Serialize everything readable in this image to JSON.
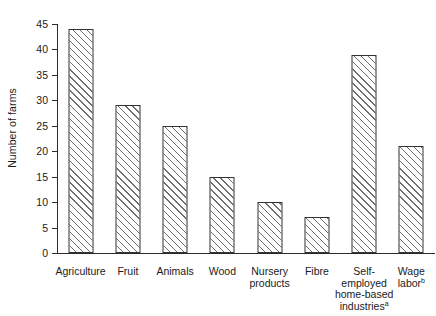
{
  "chart_data": {
    "type": "bar",
    "title": "",
    "xlabel": "",
    "ylabel": "Number of farms",
    "ylim": [
      0,
      45
    ],
    "ytick_step": 5,
    "yticks": [
      0,
      5,
      10,
      15,
      20,
      25,
      30,
      35,
      40,
      45
    ],
    "ytick_labels": [
      "0",
      "5",
      "10",
      "15",
      "20",
      "25",
      "30",
      "35",
      "40",
      "45"
    ],
    "grid": false,
    "legend": null,
    "bar_style": {
      "fill": "white",
      "hatch": "forward-diagonal",
      "edge_color": "#333333",
      "hatch_color": "#6e6e6e"
    },
    "categories": [
      "Agriculture",
      "Fruit",
      "Animals",
      "Wood",
      "Nursery products",
      "Fibre",
      "Self-employed home-based industries",
      "Wage labor"
    ],
    "category_lines": [
      [
        "Agriculture"
      ],
      [
        "Fruit"
      ],
      [
        "Animals"
      ],
      [
        "Wood"
      ],
      [
        "Nursery",
        "products"
      ],
      [
        "Fibre"
      ],
      [
        "Self-",
        "employed",
        "home-based",
        "industries"
      ],
      [
        "Wage",
        "labor"
      ]
    ],
    "category_footnotes": [
      "",
      "",
      "",
      "",
      "",
      "",
      "a",
      "b"
    ],
    "values": [
      44,
      29,
      25,
      15,
      10,
      7,
      39,
      21
    ]
  }
}
